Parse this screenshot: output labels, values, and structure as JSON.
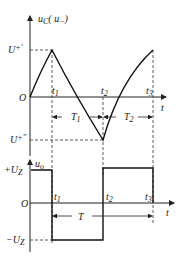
{
  "diagram": {
    "type": "waveform",
    "top_plot": {
      "y_axis_label": "u_C(u_-)",
      "x_axis_label": "t",
      "origin_label": "O",
      "upper_threshold_label": "U+'",
      "lower_threshold_label": "U+\"",
      "time_marks": [
        "t1",
        "t2",
        "t3"
      ],
      "interval_labels": [
        "T1",
        "T2"
      ],
      "description": "Capacitor voltage rises from 0 to U+' at t1, falls exponentially to U+\" at t2, rises back to U+' at t3"
    },
    "bottom_plot": {
      "y_axis_label": "u_o",
      "x_axis_label": "t",
      "origin_label": "O",
      "high_level_label": "+U_Z",
      "low_level_label": "-U_Z",
      "time_marks": [
        "t1",
        "t2",
        "t3"
      ],
      "period_label": "T",
      "description": "Square wave output: +U_Z from 0 to t1, -U_Z from t1 to t2, +U_Z from t2 to t3"
    }
  },
  "text": {
    "uc_main": "u",
    "uc_sub": "C",
    "uc_paren": "( u",
    "uc_paren_sub": "−",
    "uc_close": ")",
    "up1_main": "U",
    "up1_sup": "+'",
    "up2_main": "U",
    "up2_sup": "+\"",
    "origin": "O",
    "t_axis": "t",
    "t1": "t",
    "t1_sub": "1",
    "t2": "t",
    "t2_sub": "2",
    "t3": "t",
    "t3_sub": "3",
    "T1": "T",
    "T1_sub": "1",
    "T2": "T",
    "T2_sub": "2",
    "uo_main": "u",
    "uo_sub": "o",
    "plus_uz": "+U",
    "plus_uz_sub": "Z",
    "minus_uz": "−U",
    "minus_uz_sub": "Z",
    "T": "T"
  }
}
